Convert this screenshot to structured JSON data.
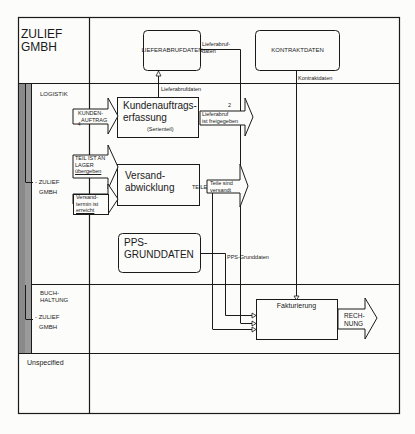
{
  "diagram": {
    "organization": {
      "name_line1": "ZULIEF",
      "name_line2": "GMBH"
    },
    "lanes": [
      {
        "id": "logistik",
        "label": "LOGISTIK",
        "sub_label_line1": "- ZULIEF",
        "sub_label_line2": "GMBH"
      },
      {
        "id": "buchhaltung",
        "label_line1": "BUCH-",
        "label_line2": "HALTUNG",
        "sub_label_line1": "- ZULIEF",
        "sub_label_line2": "GMBH"
      },
      {
        "id": "unspecified",
        "label": "Unspecified"
      }
    ],
    "data_objects": {
      "lieferabrufdaten": "LIEFERABRUFDATEN",
      "kontraktdaten": "KONTRAKTDATEN",
      "pps_line1": "PPS-",
      "pps_line2": "GRUNDDATEN"
    },
    "functions": {
      "kundenauftrag_line1": "Kundenauftrags-",
      "kundenauftrag_line2": "erfassung",
      "kundenauftrag_note": "(Serienteil)",
      "versand_line1": "Versand-",
      "versand_line2": "abwicklung",
      "fakturierung": "Fakturierung"
    },
    "events": {
      "kundenauftrag_line1": "KUNDEN-",
      "kundenauftrag_line2": "AUFTRAG",
      "kundenauftrag_number": "4",
      "teil_lager_line1": "TEIL IST AN",
      "teil_lager_line2": "LAGER",
      "teil_lager_line3": "übergeben",
      "versandtermin_line1": "Versand-",
      "versandtermin_line2": "termin ist",
      "versandtermin_line3": "erreicht",
      "lieferabruf_number": "2",
      "lieferabruf_line1": "Lieferabruf",
      "lieferabruf_line2": "ist freigegeben",
      "teile_versandt_line1": "Teile sind",
      "teile_versandt_line2": "versandt",
      "rechnung_line1": "RECH-",
      "rechnung_line2": "NUNG"
    },
    "flow_labels": {
      "lieferabrufdaten_out_line1": "Lieferabruf-",
      "lieferabrufdaten_out_line2": "daten",
      "lieferabrufdaten_in": "Lieferabrufdaten",
      "kontraktdaten": "Kontraktdaten",
      "teile": "TEILE",
      "pps_grunddaten": "PPS-Grunddaten"
    },
    "colors": {
      "line": "#1a1a1a",
      "lane_bar": "#8a8a8a",
      "background": "#fcfcfa"
    }
  }
}
